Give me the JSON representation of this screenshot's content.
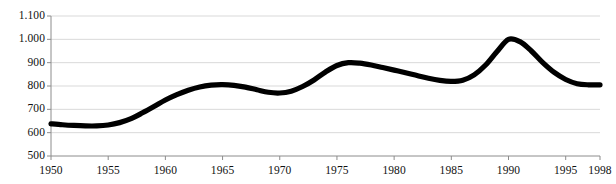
{
  "chart_data": {
    "type": "line",
    "title": "",
    "xlabel": "",
    "ylabel": "",
    "xlim": [
      1950,
      1998
    ],
    "ylim": [
      500,
      1100
    ],
    "grid": true,
    "legend": "none",
    "line_color": "#000000",
    "grid_color": "#d9d9d9",
    "axis_color": "#8c8c8c",
    "xtick_labels": [
      "1950",
      "1955",
      "1960",
      "1965",
      "1970",
      "1975",
      "1980",
      "1985",
      "1990",
      "1995",
      "1998"
    ],
    "xtick_values": [
      1950,
      1955,
      1960,
      1965,
      1970,
      1975,
      1980,
      1985,
      1990,
      1995,
      1998
    ],
    "ytick_labels": [
      "1.100",
      "1.000",
      "900",
      "800",
      "700",
      "600",
      "500"
    ],
    "ytick_values": [
      1100,
      1000,
      900,
      800,
      700,
      600,
      500
    ],
    "x": [
      1950,
      1951,
      1952,
      1953,
      1954,
      1955,
      1956,
      1957,
      1958,
      1959,
      1960,
      1961,
      1962,
      1963,
      1964,
      1965,
      1966,
      1967,
      1968,
      1969,
      1970,
      1971,
      1972,
      1973,
      1974,
      1975,
      1976,
      1977,
      1978,
      1979,
      1980,
      1981,
      1982,
      1983,
      1984,
      1985,
      1986,
      1987,
      1988,
      1989,
      1990,
      1991,
      1992,
      1993,
      1994,
      1995,
      1996,
      1997,
      1998
    ],
    "values": [
      638,
      634,
      631,
      629,
      629,
      633,
      643,
      660,
      685,
      712,
      740,
      763,
      782,
      796,
      804,
      806,
      803,
      795,
      784,
      773,
      770,
      778,
      798,
      826,
      860,
      888,
      900,
      898,
      890,
      879,
      868,
      857,
      845,
      833,
      824,
      820,
      825,
      848,
      890,
      948,
      1000,
      990,
      950,
      900,
      858,
      828,
      810,
      805,
      805
    ],
    "series_name": ""
  }
}
